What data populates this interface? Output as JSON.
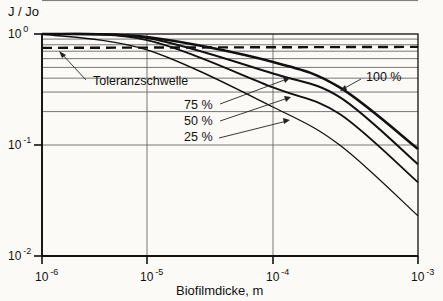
{
  "chart_data": {
    "type": "line",
    "title": "",
    "xlabel": "Biofilmdicke,  m",
    "ylabel": "J / Jo",
    "xscale": "log",
    "yscale": "log",
    "xlim": [
      1e-06,
      0.001
    ],
    "ylim": [
      0.01,
      1
    ],
    "grid": true,
    "x_ticks": [
      {
        "base": "10",
        "exp": "-6",
        "log": -6
      },
      {
        "base": "10",
        "exp": "-5",
        "log": -5
      },
      {
        "base": "10",
        "exp": "-4",
        "log": -4
      },
      {
        "base": "10",
        "exp": "-3",
        "log": -3
      }
    ],
    "y_ticks": [
      {
        "base": "10",
        "exp": "0",
        "log": 0
      },
      {
        "base": "10",
        "exp": "-1",
        "log": -1
      },
      {
        "base": "10",
        "exp": "-2",
        "log": -2
      }
    ],
    "series": [
      {
        "name": "100 %",
        "x_log": [
          -6,
          -5,
          -4,
          -3.54,
          -3
        ],
        "y": [
          1.0,
          0.94,
          0.56,
          0.33,
          0.092
        ],
        "width": 2.6
      },
      {
        "name": "75 %",
        "x_log": [
          -6,
          -5,
          -4,
          -3.54,
          -3
        ],
        "y": [
          1.0,
          0.92,
          0.44,
          0.27,
          0.067
        ],
        "width": 2.0
      },
      {
        "name": "50 %",
        "x_log": [
          -6,
          -5,
          -4,
          -3.54,
          -3
        ],
        "y": [
          1.0,
          0.88,
          0.33,
          0.19,
          0.046
        ],
        "width": 1.8
      },
      {
        "name": "25 %",
        "x_log": [
          -6,
          -5,
          -4,
          -3.54,
          -3
        ],
        "y": [
          1.0,
          0.72,
          0.22,
          0.1,
          0.023
        ],
        "width": 1.3
      }
    ],
    "threshold": {
      "label": "Toleranzschwelle",
      "y": 0.75,
      "style": "dashed"
    },
    "annotations": [
      {
        "text": "Toleranzschwelle",
        "target": "threshold"
      },
      {
        "text": "100 %",
        "target": "100 %"
      },
      {
        "text": "75 %",
        "target": "75 %"
      },
      {
        "text": "50 %",
        "target": "50 %"
      },
      {
        "text": "25 %",
        "target": "25 %"
      }
    ]
  },
  "labels": {
    "ylabel": "J / Jo",
    "xlabel": "Biofilmdicke,  m",
    "threshold": "Toleranzschwelle",
    "s100": "100 %",
    "s75": "75 %",
    "s50": "50 %",
    "s25": "25 %"
  },
  "colors": {
    "ink": "#111111",
    "grid": "#555555",
    "background": "#fbfaf6"
  }
}
